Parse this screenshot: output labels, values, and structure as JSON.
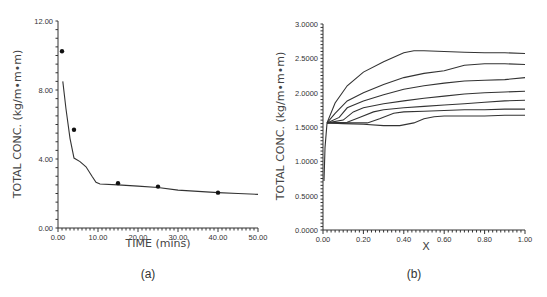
{
  "chart_data": [
    {
      "panel": "(a)",
      "type": "line",
      "title": "",
      "xlabel": "TIME  (mins)",
      "ylabel": "TOTAL  CONC.  (kg/m•m•m)",
      "xlim": [
        0,
        50
      ],
      "ylim": [
        0,
        12
      ],
      "xticks": [
        "0.00",
        "10.00",
        "20.00",
        "30.00",
        "40.00",
        "50.00"
      ],
      "yticks": [
        "0.00",
        "4.00",
        "8.00",
        "12.00"
      ],
      "grid": false,
      "legend": null,
      "series": [
        {
          "name": "model",
          "kind": "line",
          "x": [
            1.2,
            2.0,
            3.0,
            4.0,
            5.5,
            7.0,
            8.5,
            9.5,
            10.5,
            15,
            20,
            25,
            30,
            35,
            40,
            45,
            50
          ],
          "y": [
            8.5,
            6.9,
            5.2,
            4.05,
            3.85,
            3.55,
            3.0,
            2.65,
            2.55,
            2.5,
            2.43,
            2.35,
            2.2,
            2.12,
            2.05,
            2.0,
            1.95
          ]
        },
        {
          "name": "measured",
          "kind": "scatter",
          "x": [
            1.0,
            4.0,
            15.0,
            25.0,
            40.0
          ],
          "y": [
            10.25,
            5.7,
            2.6,
            2.4,
            2.05
          ]
        }
      ]
    },
    {
      "panel": "(b)",
      "type": "line",
      "title": "",
      "xlabel": "X",
      "ylabel": "TOTAL  CONC.  (kg/m•m•m)",
      "xlim": [
        0,
        1
      ],
      "ylim": [
        0,
        3
      ],
      "xticks": [
        "0.00",
        "0.20",
        "0.40",
        "0.60",
        "0.80",
        "1.00"
      ],
      "yticks": [
        "0.0000",
        "0.5000",
        "1.0000",
        "1.5000",
        "2.0000",
        "2.5000",
        "3.0000"
      ],
      "grid": false,
      "legend": null,
      "ramp": {
        "x": [
          0.005,
          0.01,
          0.02
        ],
        "y": [
          0.72,
          1.2,
          1.56
        ]
      },
      "series": [
        {
          "name": "curve-1",
          "x": [
            0.02,
            0.06,
            0.12,
            0.2,
            0.3,
            0.4,
            0.45,
            0.5,
            0.6,
            0.7,
            0.8,
            0.9,
            1.0
          ],
          "y": [
            1.56,
            1.85,
            2.1,
            2.3,
            2.45,
            2.58,
            2.61,
            2.61,
            2.6,
            2.59,
            2.58,
            2.58,
            2.57
          ]
        },
        {
          "name": "curve-2",
          "x": [
            0.02,
            0.06,
            0.12,
            0.2,
            0.3,
            0.4,
            0.5,
            0.6,
            0.7,
            0.8,
            0.9,
            1.0
          ],
          "y": [
            1.56,
            1.7,
            1.88,
            2.0,
            2.12,
            2.22,
            2.28,
            2.32,
            2.4,
            2.42,
            2.42,
            2.41
          ]
        },
        {
          "name": "curve-3",
          "x": [
            0.02,
            0.08,
            0.12,
            0.2,
            0.3,
            0.4,
            0.5,
            0.6,
            0.7,
            0.8,
            0.9,
            1.0
          ],
          "y": [
            1.56,
            1.64,
            1.78,
            1.88,
            1.97,
            2.05,
            2.1,
            2.14,
            2.17,
            2.18,
            2.19,
            2.22
          ]
        },
        {
          "name": "curve-4",
          "x": [
            0.02,
            0.1,
            0.15,
            0.2,
            0.3,
            0.4,
            0.5,
            0.6,
            0.7,
            0.8,
            0.9,
            1.0
          ],
          "y": [
            1.56,
            1.6,
            1.72,
            1.78,
            1.84,
            1.88,
            1.92,
            1.95,
            1.98,
            2.0,
            2.01,
            2.02
          ]
        },
        {
          "name": "curve-5",
          "x": [
            0.02,
            0.12,
            0.18,
            0.25,
            0.3,
            0.4,
            0.5,
            0.6,
            0.7,
            0.8,
            0.9,
            1.0
          ],
          "y": [
            1.56,
            1.57,
            1.64,
            1.72,
            1.75,
            1.78,
            1.8,
            1.82,
            1.84,
            1.86,
            1.88,
            1.89
          ]
        },
        {
          "name": "curve-6",
          "x": [
            0.02,
            0.15,
            0.22,
            0.28,
            0.35,
            0.4,
            0.5,
            0.6,
            0.7,
            0.8,
            0.9,
            1.0
          ],
          "y": [
            1.56,
            1.56,
            1.56,
            1.62,
            1.7,
            1.72,
            1.73,
            1.74,
            1.75,
            1.75,
            1.76,
            1.76
          ]
        },
        {
          "name": "curve-7",
          "x": [
            0.02,
            0.1,
            0.2,
            0.3,
            0.38,
            0.45,
            0.5,
            0.55,
            0.6,
            0.7,
            0.8,
            0.9,
            1.0
          ],
          "y": [
            1.56,
            1.55,
            1.54,
            1.52,
            1.52,
            1.56,
            1.62,
            1.65,
            1.66,
            1.66,
            1.66,
            1.67,
            1.67
          ]
        }
      ]
    }
  ],
  "panels": {
    "a": {
      "label": "(a)",
      "xlabel": "TIME  (mins)",
      "ylabel": "TOTAL  CONC.  (kg/m•m•m)"
    },
    "b": {
      "label": "(b)",
      "xlabel": "X",
      "ylabel": "TOTAL  CONC.  (kg/m•m•m)"
    }
  }
}
